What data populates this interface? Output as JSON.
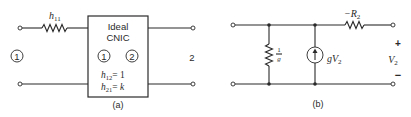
{
  "figure_a": {
    "caption": "(a)",
    "series_resistor_label": "h",
    "series_resistor_sub": "11",
    "port1_label": "1",
    "port2_label": "2",
    "box": {
      "title_line1": "Ideal",
      "title_line2": "CNIC",
      "inner_port1": "1",
      "inner_port2": "2",
      "param1_name": "h",
      "param1_sub": "12",
      "param1_value": "= 1",
      "param2_name": "h",
      "param2_sub": "21",
      "param2_value": "= k"
    }
  },
  "figure_b": {
    "caption": "(b)",
    "shunt_resistor_num": "1",
    "shunt_resistor_den": "g",
    "source_label": "gV",
    "source_label_sub": "2",
    "series_resistor_label": "−R",
    "series_resistor_sub": "2",
    "output_plus": "+",
    "output_minus": "−",
    "output_voltage": "V",
    "output_voltage_sub": "2"
  }
}
